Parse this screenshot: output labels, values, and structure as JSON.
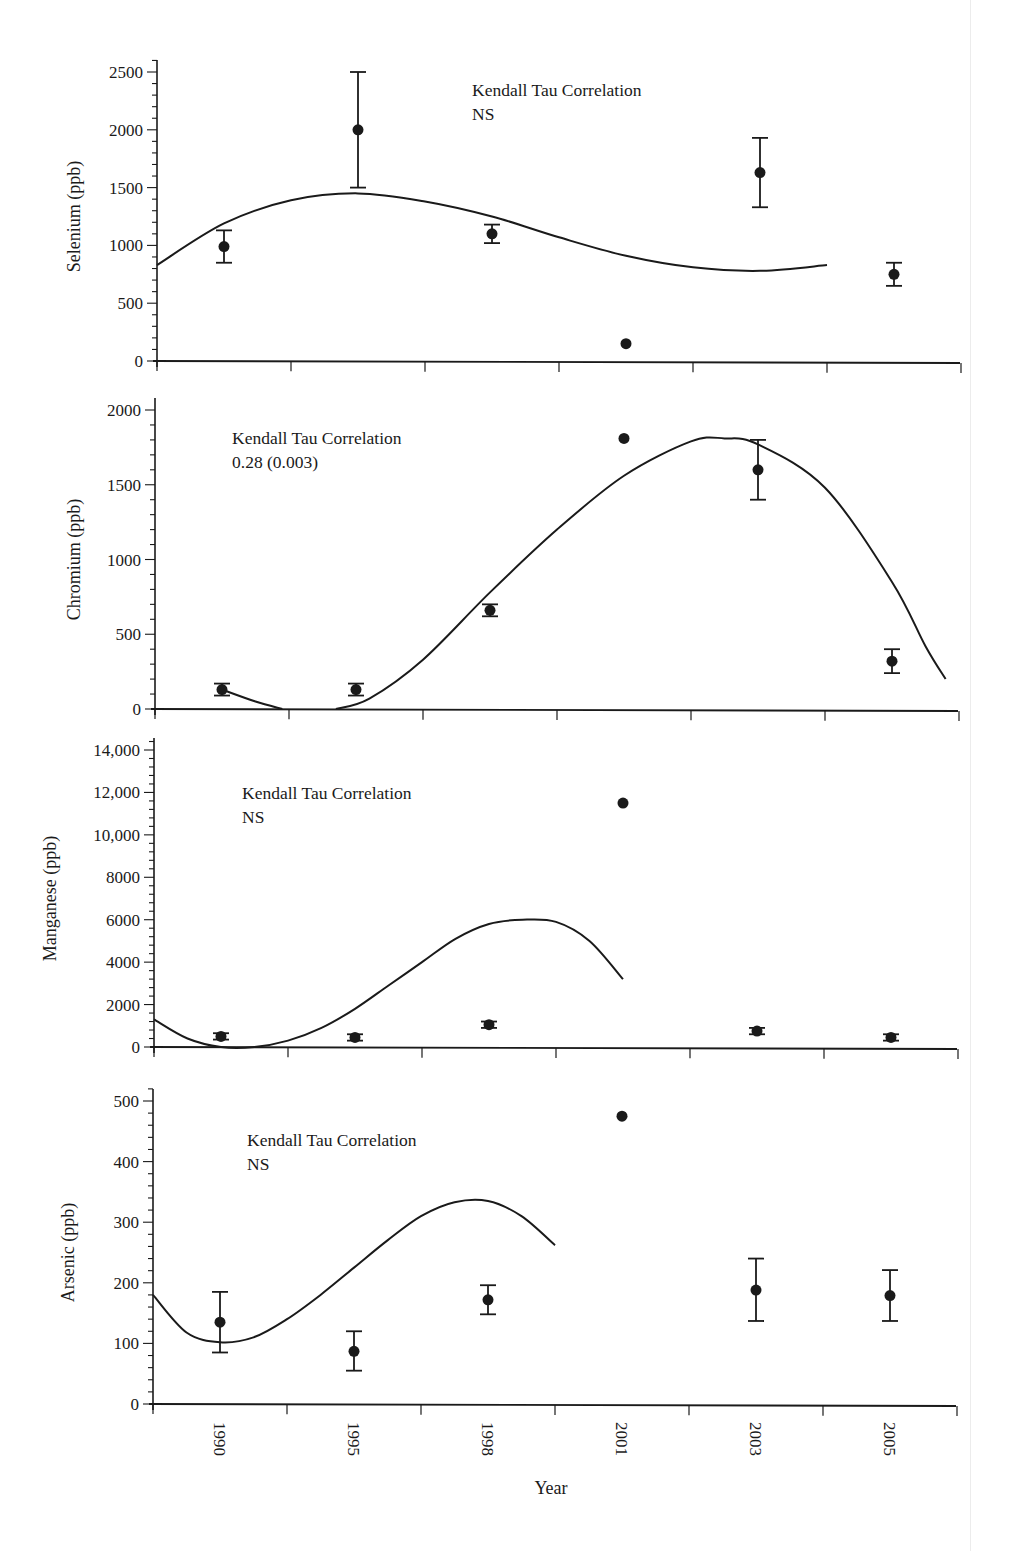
{
  "chart_data": [
    {
      "type": "scatter",
      "title": "",
      "xlabel": "",
      "ylabel": "Selenium (ppb)",
      "ylim": [
        0,
        2500
      ],
      "yticks": [
        0,
        500,
        1000,
        1500,
        2000,
        2500
      ],
      "ytick_labels": [
        "0",
        "500",
        "1000",
        "1500",
        "2000",
        "2500"
      ],
      "categories": [
        "1990",
        "1995",
        "1998",
        "2001",
        "2003",
        "2005"
      ],
      "values": [
        990,
        2000,
        1100,
        150,
        1630,
        750
      ],
      "error_low": [
        850,
        1500,
        1020,
        null,
        1330,
        650
      ],
      "error_high": [
        1130,
        2500,
        1180,
        null,
        1930,
        850
      ],
      "trend_line": {
        "type": "polynomial fit",
        "points": [
          [
            0,
            830
          ],
          [
            0.5,
            1190
          ],
          [
            1,
            1390
          ],
          [
            1.5,
            1450
          ],
          [
            2,
            1380
          ],
          [
            2.5,
            1250
          ],
          [
            3,
            1070
          ],
          [
            3.5,
            910
          ],
          [
            4,
            810
          ],
          [
            4.5,
            780
          ],
          [
            5,
            830
          ]
        ]
      },
      "annotation": {
        "line1": "Kendall Tau Correlation",
        "line2": "NS"
      },
      "grid": false
    },
    {
      "type": "scatter",
      "title": "",
      "xlabel": "",
      "ylabel": "Chromium (ppb)",
      "ylim": [
        0,
        2000
      ],
      "yticks": [
        0,
        500,
        1000,
        1500,
        2000
      ],
      "ytick_labels": [
        "0",
        "500",
        "1000",
        "1500",
        "2000"
      ],
      "categories": [
        "1990",
        "1995",
        "1998",
        "2001",
        "2003",
        "2005"
      ],
      "values": [
        130,
        130,
        660,
        1810,
        1600,
        320
      ],
      "error_low": [
        90,
        90,
        620,
        null,
        1400,
        240
      ],
      "error_high": [
        170,
        170,
        700,
        null,
        1800,
        400
      ],
      "trend_line": {
        "type": "polynomial fit",
        "segments": [
          [
            [
              0.5,
              130
            ],
            [
              0.75,
              50
            ],
            [
              0.95,
              0
            ]
          ],
          [
            [
              1.35,
              0
            ],
            [
              1.6,
              70
            ],
            [
              2,
              330
            ],
            [
              2.5,
              780
            ],
            [
              3,
              1200
            ],
            [
              3.5,
              1560
            ],
            [
              4,
              1790
            ],
            [
              4.25,
              1810
            ],
            [
              4.5,
              1770
            ],
            [
              5,
              1480
            ],
            [
              5.5,
              850
            ],
            [
              5.75,
              420
            ],
            [
              5.9,
              200
            ]
          ]
        ]
      },
      "annotation": {
        "line1": "Kendall Tau Correlation",
        "line2": "0.28 (0.003)"
      },
      "grid": false
    },
    {
      "type": "scatter",
      "title": "",
      "xlabel": "",
      "ylabel": "Manganese (ppb)",
      "ylim": [
        0,
        14000
      ],
      "yticks": [
        0,
        2000,
        4000,
        6000,
        8000,
        10000,
        12000,
        14000
      ],
      "ytick_labels": [
        "0",
        "2000",
        "4000",
        "6000",
        "8000",
        "10,000",
        "12,000",
        "14,000"
      ],
      "categories": [
        "1990",
        "1995",
        "1998",
        "2001",
        "2003",
        "2005"
      ],
      "values": [
        500,
        450,
        1050,
        11500,
        750,
        450
      ],
      "error_low": [
        350,
        300,
        900,
        null,
        600,
        300
      ],
      "error_high": [
        650,
        600,
        1200,
        null,
        900,
        600
      ],
      "trend_line": {
        "type": "polynomial fit",
        "points": [
          [
            0,
            1300
          ],
          [
            0.5,
            400
          ],
          [
            1,
            0
          ],
          [
            1.5,
            0
          ],
          [
            2,
            300
          ],
          [
            2.5,
            900
          ],
          [
            3,
            1800
          ],
          [
            3.5,
            2900
          ],
          [
            4,
            4000
          ],
          [
            4.5,
            5100
          ],
          [
            5,
            5800
          ],
          [
            5.5,
            6000
          ],
          [
            6,
            5900
          ],
          [
            6.5,
            5000
          ],
          [
            7,
            3200
          ]
        ]
      },
      "annotation": {
        "line1": "Kendall Tau Correlation",
        "line2": "NS"
      },
      "grid": false
    },
    {
      "type": "scatter",
      "title": "",
      "xlabel": "Year",
      "ylabel": "Arsenic (ppb)",
      "ylim": [
        0,
        500
      ],
      "yticks": [
        0,
        100,
        200,
        300,
        400,
        500
      ],
      "ytick_labels": [
        "0",
        "100",
        "200",
        "300",
        "400",
        "500"
      ],
      "categories": [
        "1990",
        "1995",
        "1998",
        "2001",
        "2003",
        "2005"
      ],
      "values": [
        135,
        87,
        172,
        475,
        188,
        179
      ],
      "error_low": [
        85,
        55,
        148,
        null,
        137,
        137
      ],
      "error_high": [
        185,
        120,
        196,
        null,
        240,
        221
      ],
      "trend_line": {
        "type": "polynomial fit",
        "points": [
          [
            0,
            180
          ],
          [
            0.5,
            118
          ],
          [
            1,
            102
          ],
          [
            1.5,
            110
          ],
          [
            2,
            140
          ],
          [
            2.5,
            180
          ],
          [
            3,
            225
          ],
          [
            3.5,
            270
          ],
          [
            4,
            310
          ],
          [
            4.5,
            333
          ],
          [
            5,
            335
          ],
          [
            5.5,
            310
          ],
          [
            6,
            262
          ]
        ]
      },
      "annotation": {
        "line1": "Kendall Tau Correlation",
        "line2": "NS"
      },
      "grid": false
    }
  ],
  "x_axis": {
    "label": "Year",
    "tick_labels": [
      "1990",
      "1995",
      "1998",
      "2001",
      "2003",
      "2005"
    ]
  },
  "colors": {
    "ink": "#1a1a1a",
    "background": "#ffffff"
  }
}
